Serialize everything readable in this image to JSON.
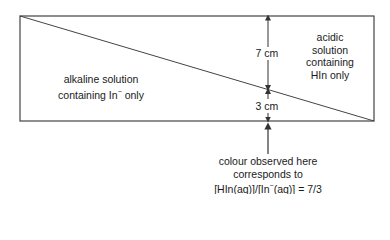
{
  "diagram": {
    "left_region": {
      "line1": "alkaline solution",
      "line2": "containing In",
      "line2_sup": "−",
      "line2_end": " only"
    },
    "right_region": {
      "line1": "acidic",
      "line2": "solution",
      "line3": "containing",
      "line4": "HIn only"
    },
    "upper_distance": "7 cm",
    "lower_distance": "3 cm",
    "caption": {
      "line1": "colour observed here",
      "line2": "corresponds to",
      "line3_a": "[HIn(aq)]/[In",
      "line3_sup": "−",
      "line3_b": "(aq)] = ",
      "line3_frac": "7/3"
    },
    "colors": {
      "line": "#333333",
      "background": "#ffffff"
    }
  }
}
